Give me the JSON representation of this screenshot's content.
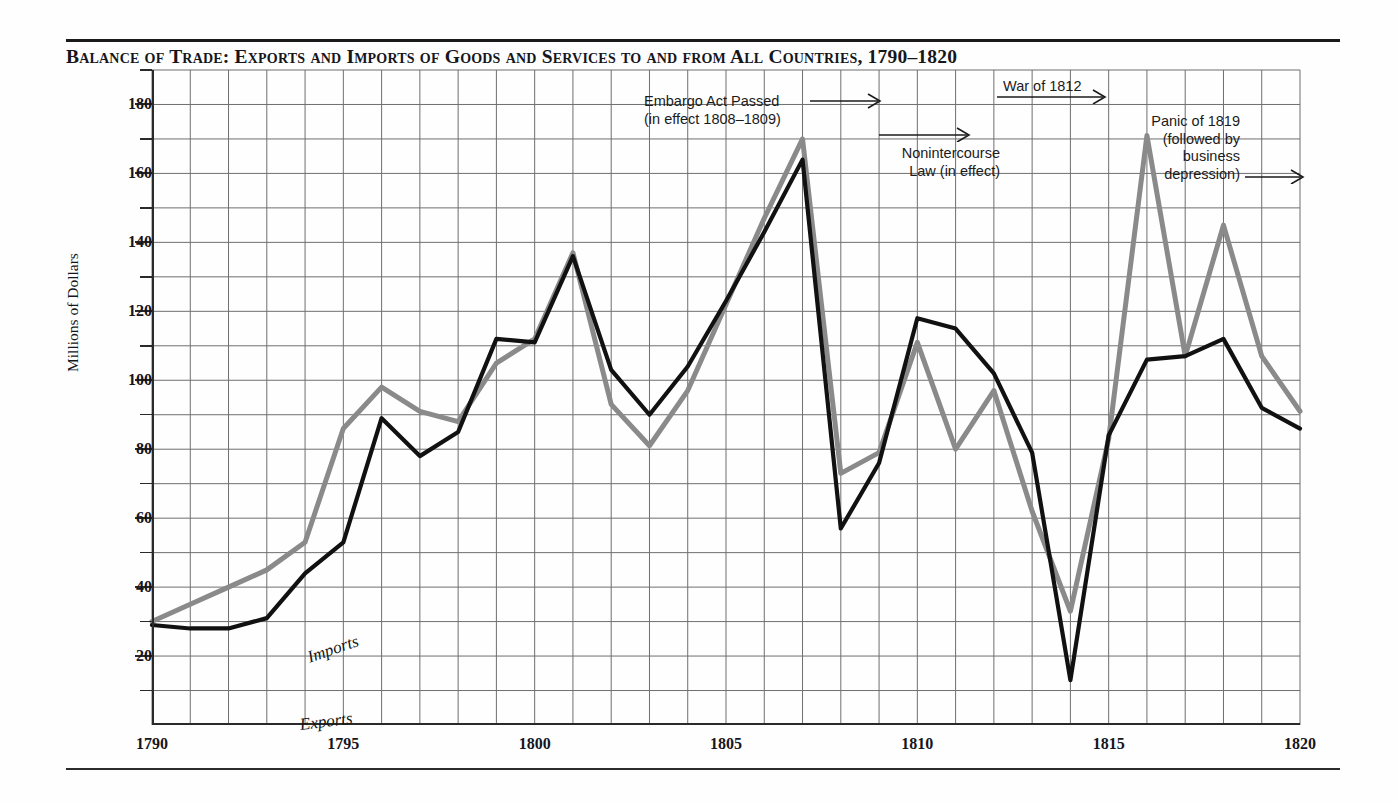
{
  "title": "Balance of Trade: Exports and Imports of Goods and Services to and from All Countries, 1790–1820",
  "axes": {
    "ylabel": "Millions of Dollars",
    "y_ticks": [
      20,
      40,
      60,
      80,
      100,
      120,
      140,
      160,
      180
    ],
    "y_minor_ticks": [
      10,
      30,
      50,
      70,
      90,
      110,
      130,
      150,
      170,
      190
    ],
    "x_ticks": [
      1790,
      1795,
      1800,
      1805,
      1810,
      1815,
      1820
    ]
  },
  "series_labels": {
    "imports": "Imports",
    "exports": "Exports"
  },
  "annotations": [
    {
      "id": "embargo",
      "text": "Embargo Act Passed\n(in effect 1808–1809)"
    },
    {
      "id": "nonintercourse",
      "text": "Nonintercourse\nLaw (in effect)"
    },
    {
      "id": "war1812",
      "text": "War of 1812"
    },
    {
      "id": "panic1819",
      "text": "Panic of 1819\n(followed by\nbusiness\ndepression)"
    }
  ],
  "colors": {
    "exports_line": "#111111",
    "imports_line": "#8a8a8a",
    "grid": "#6f6f6f",
    "axis": "#2a2a2a",
    "text": "#15161c",
    "background": "#fefefe"
  },
  "chart_data": {
    "type": "line",
    "title": "Balance of Trade: Exports and Imports of Goods and Services to and from All Countries, 1790–1820",
    "xlabel": "",
    "ylabel": "Millions of Dollars",
    "xlim": [
      1790,
      1820
    ],
    "ylim": [
      0,
      190
    ],
    "grid": true,
    "legend": "inline-labels",
    "x": [
      1790,
      1791,
      1792,
      1793,
      1794,
      1795,
      1796,
      1797,
      1798,
      1799,
      1800,
      1801,
      1802,
      1803,
      1804,
      1805,
      1806,
      1807,
      1808,
      1809,
      1810,
      1811,
      1812,
      1813,
      1814,
      1815,
      1816,
      1817,
      1818,
      1819,
      1820
    ],
    "series": [
      {
        "name": "Imports",
        "color": "#8a8a8a",
        "values": [
          30,
          35,
          40,
          45,
          53,
          86,
          98,
          91,
          88,
          105,
          112,
          137,
          93,
          81,
          97,
          122,
          147,
          170,
          73,
          79,
          111,
          80,
          97,
          62,
          33,
          83,
          171,
          107,
          145,
          107,
          91
        ]
      },
      {
        "name": "Exports",
        "color": "#111111",
        "values": [
          29,
          28,
          28,
          31,
          44,
          53,
          89,
          78,
          85,
          112,
          111,
          136,
          103,
          90,
          104,
          123,
          143,
          164,
          57,
          76,
          118,
          115,
          102,
          79,
          13,
          84,
          106,
          107,
          112,
          92,
          86
        ]
      }
    ]
  }
}
